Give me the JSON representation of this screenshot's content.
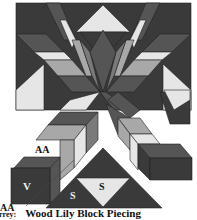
{
  "figure": {
    "caption_prefix": "rrey:",
    "caption_title": "Wood Lily Block Piecing",
    "labels": {
      "aa_top": "AA",
      "v": "V",
      "s_left": "S",
      "s_center": "S",
      "aa_bottom": "AA"
    },
    "colors": {
      "darkest": "#3a3a3a",
      "dark": "#555555",
      "medium": "#7a7a7a",
      "light": "#a8a8a8",
      "lightest": "#e6e6e6",
      "background": "#ffffff"
    }
  }
}
